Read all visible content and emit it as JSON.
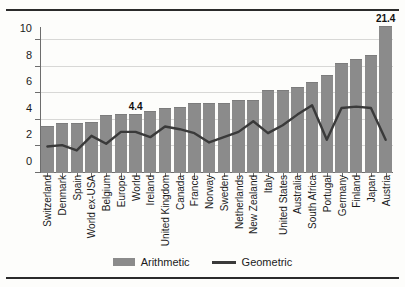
{
  "chart_data": {
    "type": "bar",
    "title": "",
    "subtitle": "",
    "xlabel": "",
    "ylabel": "",
    "ylim": [
      0,
      11
    ],
    "yticks": [
      0,
      2,
      4,
      6,
      8,
      10
    ],
    "ytick_labels": [
      "0",
      "2",
      "4",
      "6",
      "8",
      "10"
    ],
    "grid": true,
    "legend_position": "bottom-center",
    "categories": [
      "Switzerland",
      "Denmark",
      "Spain",
      "World ex-USA",
      "Belgium",
      "Europe",
      "World",
      "Ireland",
      "United Kingdom",
      "Canada",
      "France",
      "Norway",
      "Sweden",
      "Netherlands",
      "New Zealand",
      "Italy",
      "United States",
      "Australia",
      "South Africa",
      "Portugal",
      "Germany",
      "Finland",
      "Japan",
      "Austria"
    ],
    "series": [
      {
        "name": "Arithmetic",
        "type": "bar",
        "color": "#8b8b8b",
        "values": [
          3.5,
          3.7,
          3.7,
          3.8,
          4.3,
          4.4,
          4.4,
          4.6,
          4.8,
          4.9,
          5.2,
          5.2,
          5.2,
          5.4,
          5.4,
          6.2,
          6.2,
          6.4,
          6.8,
          7.3,
          8.2,
          8.5,
          8.8,
          21.4
        ]
      },
      {
        "name": "Geometric",
        "type": "line",
        "color": "#3a3a3a",
        "values": [
          2.0,
          2.1,
          1.7,
          2.8,
          2.2,
          3.1,
          3.1,
          2.7,
          3.5,
          3.3,
          3.0,
          2.3,
          2.7,
          3.1,
          3.9,
          3.0,
          3.6,
          4.4,
          5.1,
          2.5,
          4.9,
          5.0,
          4.9,
          2.5
        ]
      }
    ],
    "annotations": [
      {
        "label": "4.4",
        "category": "World",
        "series": "Arithmetic",
        "value": 4.4
      },
      {
        "label": "21.4",
        "category": "Austria",
        "series": "Arithmetic",
        "value": 21.4
      }
    ],
    "notes": {
      "truncated_bar": "Austria bar at 21.4 is clipped by the axis maximum"
    }
  },
  "legend": {
    "items": [
      {
        "label": "Arithmetic",
        "marker": "bar-swatch"
      },
      {
        "label": "Geometric",
        "marker": "line-swatch"
      }
    ]
  },
  "colors": {
    "bar": "#8b8b8b",
    "line": "#3a3a3a",
    "grid": "#d8d8d6",
    "axis": "#6d6d6d",
    "rule": "#2b2b2b",
    "background": "#fdfdfb"
  }
}
